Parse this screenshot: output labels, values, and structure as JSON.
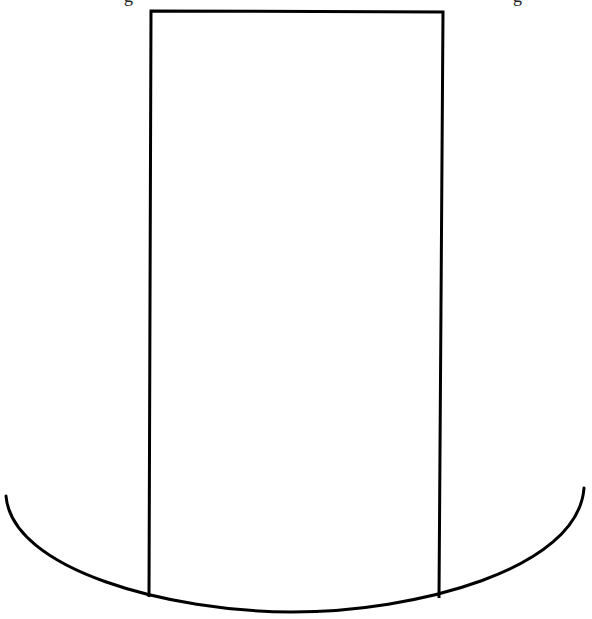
{
  "diagram": {
    "stroke_color": "#000000",
    "background_color": "#ffffff",
    "rectangle": {
      "top_left": [
        151,
        11
      ],
      "top_right": [
        443,
        12
      ],
      "bottom_left": [
        147,
        596
      ],
      "bottom_right": [
        438,
        598
      ],
      "stroke_width": 3
    },
    "arc": {
      "start": [
        6,
        496
      ],
      "control": [
        292,
        700
      ],
      "end": [
        584,
        488
      ],
      "lowest_point": [
        292,
        612
      ],
      "stroke_width": 3
    },
    "clipped_top_text": {
      "note": "Only descender fragments visible at top edge",
      "fragment_left": "g",
      "fragment_right": "g",
      "fragment_left_x": 128,
      "fragment_right_x": 517
    }
  }
}
